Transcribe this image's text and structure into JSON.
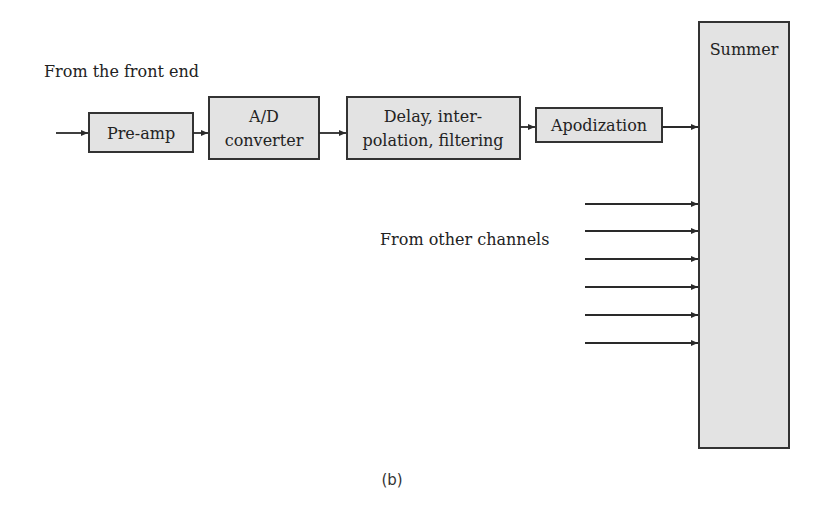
{
  "diagram": {
    "input_label": "From the front end",
    "blocks": [
      {
        "id": "preamp",
        "lines": [
          "Pre-amp"
        ]
      },
      {
        "id": "adc",
        "lines": [
          "A/D",
          "converter"
        ]
      },
      {
        "id": "delay",
        "lines": [
          "Delay, inter-",
          "polation, filtering"
        ]
      },
      {
        "id": "apodization",
        "lines": [
          "Apodization"
        ]
      },
      {
        "id": "summer",
        "lines": [
          "Summer"
        ]
      }
    ],
    "other_channels_label": "From other channels",
    "other_channel_count": 6,
    "caption": "(b)",
    "colors": {
      "block_fill": "#e3e3e3",
      "stroke": "#333333"
    }
  }
}
